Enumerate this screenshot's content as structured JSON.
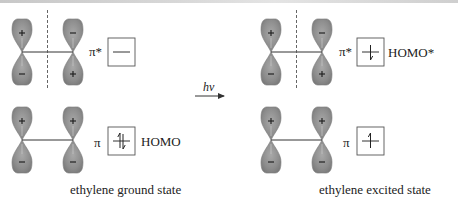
{
  "colors": {
    "lobe_fill": "#8a8a8a",
    "lobe_highlight": "#b4b4b4",
    "line": "#333333",
    "text": "#222222"
  },
  "ground_state": {
    "caption": "ethylene ground state",
    "pi_star": {
      "label": "π*",
      "electrons": [],
      "homo_label": "",
      "signs": {
        "left_top": "+",
        "left_bottom": "−",
        "right_top": "−",
        "right_bottom": "+"
      },
      "node": true
    },
    "pi": {
      "label": "π",
      "electrons": [
        "up",
        "down"
      ],
      "homo_label": "HOMO",
      "signs": {
        "left_top": "+",
        "left_bottom": "−",
        "right_top": "+",
        "right_bottom": "−"
      },
      "node": false
    }
  },
  "transition": {
    "label": "hν",
    "direction": "right-arrow"
  },
  "excited_state": {
    "caption": "ethylene excited state",
    "pi_star": {
      "label": "π*",
      "electrons": [
        "down"
      ],
      "homo_label": "HOMO*",
      "signs": {
        "left_top": "+",
        "left_bottom": "−",
        "right_top": "−",
        "right_bottom": "+"
      },
      "node": true
    },
    "pi": {
      "label": "π",
      "electrons": [
        "up"
      ],
      "homo_label": "",
      "signs": {
        "left_top": "+",
        "left_bottom": "−",
        "right_top": "+",
        "right_bottom": "−"
      },
      "node": false
    }
  }
}
